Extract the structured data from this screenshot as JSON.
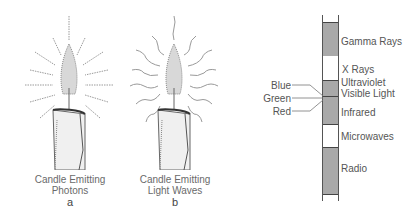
{
  "figure_a": {
    "caption_line1": "Candle Emitting",
    "caption_line2": "Photons",
    "letter": "a"
  },
  "figure_b": {
    "caption_line1": "Candle Emitting",
    "caption_line2": "Light Waves",
    "letter": "b"
  },
  "spectrum": {
    "bands": [
      {
        "label": "Gamma Rays",
        "fill": "gray"
      },
      {
        "label": "X Rays",
        "fill": "white"
      },
      {
        "label": "Ultraviolet",
        "fill": "gray"
      },
      {
        "label": "Visible Light",
        "fill": "gray"
      },
      {
        "label": "Infrared",
        "fill": "gray"
      },
      {
        "label": "Microwaves",
        "fill": "white"
      },
      {
        "label": "Radio",
        "fill": "gray"
      }
    ],
    "visible_colors": [
      "Blue",
      "Green",
      "Red"
    ],
    "colors": {
      "band_gray": "#a9a9a9",
      "line": "#444444"
    }
  }
}
